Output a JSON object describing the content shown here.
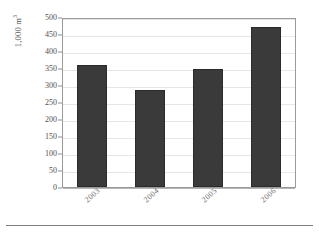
{
  "chart_data": {
    "type": "bar",
    "title": "",
    "xlabel": "",
    "ylabel": "1,000 m³",
    "ylabel_base": "1,000 m",
    "ylabel_exponent": "3",
    "categories": [
      "2003",
      "2004",
      "2005",
      "2006"
    ],
    "values": [
      358,
      285,
      347,
      470
    ],
    "ylim": [
      0,
      500
    ],
    "ytick_step": 50,
    "yticks": [
      500,
      450,
      400,
      350,
      300,
      250,
      200,
      150,
      100,
      50,
      0
    ],
    "ytick_labels": [
      "500",
      "450",
      "400",
      "350",
      "300",
      "250",
      "200",
      "150",
      "100",
      "50",
      "0"
    ],
    "grid": true,
    "legend": false,
    "series": [
      {
        "name": "Volume",
        "values": [
          358,
          285,
          347,
          470
        ]
      }
    ],
    "colors": {
      "bar_fill": "#3a3a3a",
      "bar_border": "#2b2b2b",
      "gridline": "#e6e6e6",
      "plot_border": "#9a9a9a",
      "tick_text": "#4f4f4f",
      "axis_title": "#4a4a4a",
      "background": "#ffffff"
    }
  }
}
